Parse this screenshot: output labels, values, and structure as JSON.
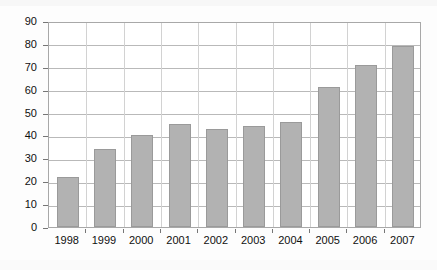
{
  "chart_data": {
    "type": "bar",
    "title": "",
    "subtitle": "",
    "xlabel": "",
    "ylabel": "",
    "categories": [
      "1998",
      "1999",
      "2000",
      "2001",
      "2002",
      "2003",
      "2004",
      "2005",
      "2006",
      "2007"
    ],
    "values": [
      22,
      34,
      40,
      45,
      43,
      44,
      46,
      61,
      71,
      79
    ],
    "series": [
      {
        "name": "",
        "values": [
          22,
          34,
          40,
          45,
          43,
          44,
          46,
          61,
          71,
          79
        ]
      }
    ],
    "ylim": [
      0,
      90
    ],
    "xlim_categories": 10,
    "y_ticks": [
      0,
      10,
      20,
      30,
      40,
      50,
      60,
      70,
      80,
      90
    ],
    "y_tick_labels": [
      "0",
      "10",
      "20",
      "30",
      "40",
      "50",
      "60",
      "70",
      "80",
      "90"
    ],
    "x_tick_labels": [
      "1998",
      "1999",
      "2000",
      "2001",
      "2002",
      "2003",
      "2004",
      "2005",
      "2006",
      "2007"
    ],
    "grid": "horizontal-and-vertical",
    "legend": "none",
    "legend_position": "none",
    "annotations": [],
    "colors": {
      "bar_fill": "#b2b2b2",
      "bar_border": "#9a9a9a",
      "gridline": "#b9b9b9",
      "vertical_gridline": "#d2d2d2",
      "plot_border": "#a8a8a8",
      "axis_text": "#101010",
      "plot_background": "#ffffff",
      "figure_background": "#fdfdfd"
    }
  }
}
